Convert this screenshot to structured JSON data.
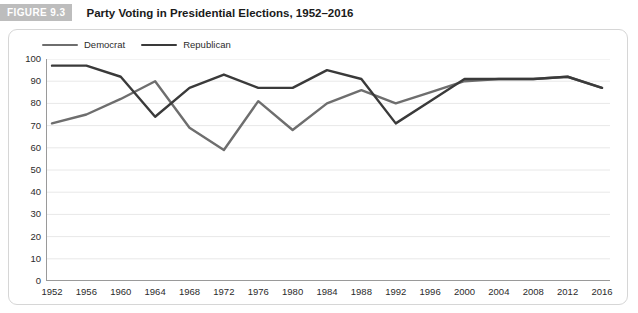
{
  "figure": {
    "badge": "FIGURE 9.3",
    "title": "Party Voting in Presidential Elections, 1952–2016"
  },
  "legend": {
    "position": "top-left",
    "items": [
      {
        "label": "Democrat",
        "color": "#6e6e6e"
      },
      {
        "label": "Republican",
        "color": "#3a3a3a"
      }
    ]
  },
  "colors": {
    "democrat": "#6e6e6e",
    "republican": "#3a3a3a",
    "grid": "#e8e8e8",
    "axis": "#9a9a9a",
    "badge_bg": "#bdbdbd",
    "panel_border": "#d6d6d6",
    "text": "#2b2b2b"
  },
  "chart_data": {
    "type": "line",
    "title": "Party Voting in Presidential Elections, 1952–2016",
    "xlabel": "",
    "ylabel": "",
    "grid": true,
    "legend_position": "top-left",
    "ylim": [
      0,
      100
    ],
    "yticks": [
      0,
      10,
      20,
      30,
      40,
      50,
      60,
      70,
      80,
      90,
      100
    ],
    "categories": [
      "1952",
      "1956",
      "1960",
      "1964",
      "1968",
      "1972",
      "1976",
      "1980",
      "1984",
      "1988",
      "1992",
      "1996",
      "2000",
      "2004",
      "2008",
      "2012",
      "2016"
    ],
    "x": [
      1952,
      1956,
      1960,
      1964,
      1968,
      1972,
      1976,
      1980,
      1984,
      1988,
      1992,
      1996,
      2000,
      2004,
      2008,
      2012,
      2016
    ],
    "series": [
      {
        "name": "Democrat",
        "color": "#6e6e6e",
        "values": [
          71,
          75,
          82,
          90,
          69,
          59,
          81,
          68,
          80,
          86,
          80,
          85,
          90,
          91,
          91,
          92,
          87
        ]
      },
      {
        "name": "Republican",
        "color": "#3a3a3a",
        "values": [
          97,
          97,
          92,
          74,
          87,
          93,
          87,
          87,
          95,
          91,
          71,
          81,
          91,
          91,
          91,
          92,
          87
        ]
      }
    ]
  }
}
